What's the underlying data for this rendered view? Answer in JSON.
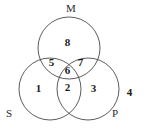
{
  "diagram": {
    "type": "venn",
    "title": "",
    "background_color": "#ffffff",
    "stroke_color": "#4a4a4a",
    "text_color": "#1a1a1a",
    "set_labels": [
      {
        "id": "set-m",
        "text": "M",
        "x": 66,
        "y": 3
      },
      {
        "id": "set-s",
        "text": "S",
        "x": 6,
        "y": 108
      },
      {
        "id": "set-p",
        "text": "P",
        "x": 112,
        "y": 108
      }
    ],
    "circles": [
      {
        "id": "circle-m",
        "label": "M",
        "cx": 69,
        "cy": 48,
        "r": 31
      },
      {
        "id": "circle-s",
        "label": "S",
        "cx": 50,
        "cy": 89,
        "r": 31
      },
      {
        "id": "circle-p",
        "label": "P",
        "cx": 88,
        "cy": 89,
        "r": 31
      }
    ],
    "regions": [
      {
        "id": "region-1",
        "text": "1",
        "sets": "S only",
        "x": 34,
        "y": 83
      },
      {
        "id": "region-2",
        "text": "2",
        "sets": "S and P",
        "x": 63,
        "y": 82
      },
      {
        "id": "region-3",
        "text": "3",
        "sets": "P only",
        "x": 89,
        "y": 83
      },
      {
        "id": "region-4",
        "text": "4",
        "sets": "outside all",
        "x": 125,
        "y": 87
      },
      {
        "id": "region-5",
        "text": "5",
        "sets": "S and M",
        "x": 47,
        "y": 57
      },
      {
        "id": "region-6",
        "text": "6",
        "sets": "S, M and P",
        "x": 63,
        "y": 65
      },
      {
        "id": "region-7",
        "text": "7",
        "sets": "M and P",
        "x": 76,
        "y": 57
      },
      {
        "id": "region-8",
        "text": "8",
        "sets": "M only",
        "x": 63,
        "y": 37
      }
    ]
  }
}
